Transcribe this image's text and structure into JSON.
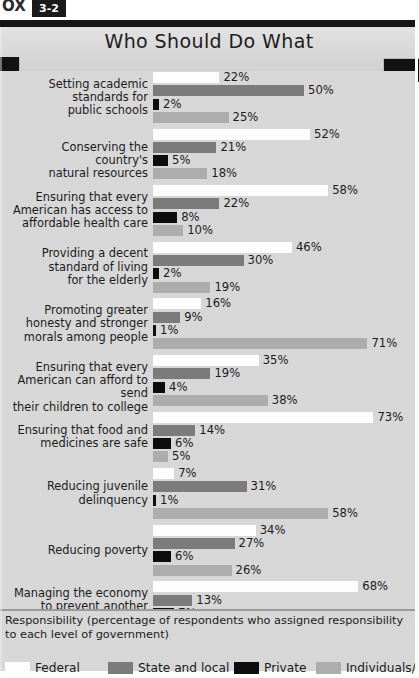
{
  "box": {
    "word": "OX",
    "number": "3-2"
  },
  "header": {
    "title": "Who Should Do What"
  },
  "footer": {
    "axis_caption": "Responsibility (percentage of respondents who assigned responsibility to each level of government)"
  },
  "legend": [
    {
      "label": "Federal",
      "key": "federal",
      "color": "#fdfdfd"
    },
    {
      "label": "State and local",
      "key": "state",
      "color": "#7b7b7b"
    },
    {
      "label": "Private",
      "key": "private",
      "color": "#0d0d0d"
    },
    {
      "label": "Individuals/",
      "key": "individuals",
      "color": "#adadad"
    }
  ],
  "chart_data": {
    "type": "bar",
    "orientation": "horizontal",
    "title": "Who Should Do What",
    "xlabel": "Responsibility (percentage of respondents who assigned responsibility to each level of government)",
    "ylabel": "",
    "xlim": [
      0,
      80
    ],
    "grid": false,
    "legend_position": "bottom",
    "value_suffix": "%",
    "categories": [
      "Setting academic standards for public schools",
      "Conserving the country's natural resources",
      "Ensuring that every American has access to affordable health care",
      "Providing a decent standard of living for the elderly",
      "Promoting greater honesty and stronger morals among people",
      "Ensuring that every American can afford to send their children to college",
      "Ensuring that food and medicines are safe",
      "Reducing juvenile delinquency",
      "Reducing poverty",
      "Managing the economy to prevent another recession or depression"
    ],
    "category_lines": [
      [
        "Setting academic",
        "standards for",
        "public schools"
      ],
      [
        "Conserving the country's",
        "natural resources"
      ],
      [
        "Ensuring that every",
        "American has access to",
        "affordable health care"
      ],
      [
        "Providing a decent",
        "standard of living",
        "for the elderly"
      ],
      [
        "Promoting greater",
        "honesty and stronger",
        "morals among people"
      ],
      [
        "Ensuring that every",
        "American can afford to send",
        "their children to college"
      ],
      [
        "Ensuring that food and",
        "medicines are safe"
      ],
      [
        "Reducing juvenile",
        "delinquency"
      ],
      [
        "Reducing poverty"
      ],
      [
        "Managing the economy",
        "to prevent another",
        "recession or depression"
      ]
    ],
    "series": [
      {
        "name": "Federal",
        "key": "federal",
        "color": "#fdfdfd",
        "values": [
          22,
          52,
          58,
          46,
          16,
          35,
          73,
          7,
          34,
          68
        ]
      },
      {
        "name": "State and local",
        "key": "state",
        "color": "#7b7b7b",
        "values": [
          50,
          21,
          22,
          30,
          9,
          19,
          14,
          31,
          27,
          13
        ]
      },
      {
        "name": "Private",
        "key": "private",
        "color": "#0d0d0d",
        "values": [
          2,
          5,
          8,
          2,
          1,
          4,
          6,
          1,
          6,
          7
        ]
      },
      {
        "name": "Individuals/",
        "key": "individuals",
        "color": "#adadad",
        "values": [
          25,
          18,
          10,
          19,
          71,
          38,
          5,
          58,
          26,
          7
        ]
      }
    ],
    "value_labels": [
      [
        "22%",
        "50%",
        "2%",
        "25%"
      ],
      [
        "52%",
        "21%",
        "5%",
        "18%"
      ],
      [
        "58%",
        "22%",
        "8%",
        "10%"
      ],
      [
        "46%",
        "30%",
        "2%",
        "19%"
      ],
      [
        "16%",
        "9%",
        "1%",
        "71%"
      ],
      [
        "35%",
        "19%",
        "4%",
        "38%"
      ],
      [
        "73%",
        "14%",
        "6%",
        "5%"
      ],
      [
        "7%",
        "31%",
        "1%",
        "58%"
      ],
      [
        "34%",
        "27%",
        "6%",
        "26%"
      ],
      [
        "68%",
        "13%",
        "7%",
        "7%"
      ]
    ]
  }
}
